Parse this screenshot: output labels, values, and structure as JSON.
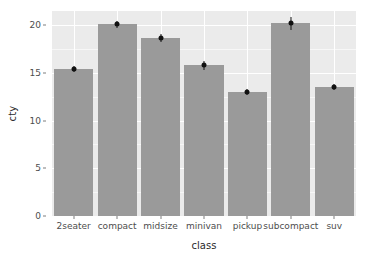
{
  "chart_data": {
    "type": "bar",
    "title": "",
    "xlabel": "class",
    "ylabel": "cty",
    "categories": [
      "2seater",
      "compact",
      "midsize",
      "minivan",
      "pickup",
      "subcompact",
      "suv"
    ],
    "values": [
      15.4,
      20.1,
      18.7,
      15.8,
      13.0,
      20.2,
      13.5
    ],
    "errors": [
      0.3,
      0.4,
      0.4,
      0.5,
      0.3,
      0.7,
      0.3
    ],
    "series": [
      {
        "name": "mean cty",
        "values": [
          15.4,
          20.1,
          18.7,
          15.8,
          13.0,
          20.2,
          13.5
        ]
      }
    ],
    "point_values": [
      15.4,
      20.1,
      18.7,
      15.8,
      13.0,
      20.2,
      13.5
    ],
    "ylim": [
      0,
      21.5
    ],
    "ytick_labels": [
      "0",
      "5",
      "10",
      "15",
      "20"
    ],
    "ytick_values": [
      0,
      5,
      10,
      15,
      20
    ],
    "minor_ytick_values": [
      2.5,
      7.5,
      12.5,
      17.5
    ],
    "grid": true,
    "legend": "none",
    "bar_color": "#9a9a9a",
    "point_color": "#111111",
    "panel_color": "#ebebeb",
    "gridline_color": "#ffffff"
  }
}
